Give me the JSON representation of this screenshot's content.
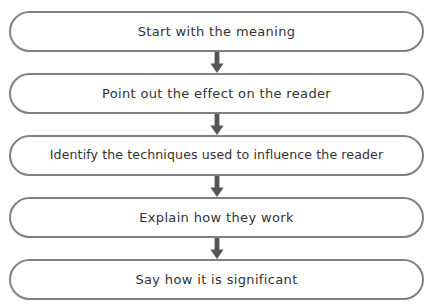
{
  "diagram": {
    "type": "vertical-flowchart",
    "background_color": "#ffffff",
    "box_border_color": "#808080",
    "box_fill_color": "#ffffff",
    "text_color": "#333333",
    "arrow_color": "#555555",
    "steps": [
      {
        "label": "Start with the meaning"
      },
      {
        "label": "Point out the effect on the reader"
      },
      {
        "label": "Identify the techniques used to influence the reader"
      },
      {
        "label": "Explain how they work"
      },
      {
        "label": "Say how it is significant"
      }
    ],
    "connectors": [
      {
        "icon": "arrow-down-icon"
      },
      {
        "icon": "arrow-down-icon"
      },
      {
        "icon": "arrow-down-icon"
      },
      {
        "icon": "arrow-down-icon"
      }
    ]
  }
}
